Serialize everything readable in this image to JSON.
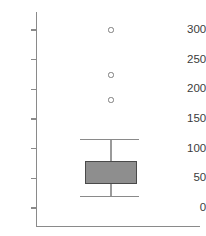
{
  "chart_data": {
    "type": "box",
    "title": "",
    "xlabel": "",
    "ylabel": "",
    "ylim": [
      -15,
      330
    ],
    "grid": false,
    "legend": null,
    "yticks": [
      0,
      50,
      100,
      150,
      200,
      250,
      300
    ],
    "ytick_labels": [
      "0",
      "50",
      "100",
      "150",
      "200",
      "250",
      "300"
    ],
    "categories": [
      "1"
    ],
    "boxes": [
      {
        "name": "1",
        "whisker_low": 20,
        "q1": 40,
        "median": 55,
        "q3": 80,
        "whisker_high": 115,
        "outliers": [
          182,
          224,
          300
        ]
      }
    ]
  },
  "axis": {
    "y_ticks": [
      {
        "label": "300",
        "value": 300
      },
      {
        "label": "250",
        "value": 250
      },
      {
        "label": "200",
        "value": 200
      },
      {
        "label": "150",
        "value": 150
      },
      {
        "label": "100",
        "value": 100
      },
      {
        "label": "50",
        "value": 50
      },
      {
        "label": "0",
        "value": 0
      }
    ]
  }
}
